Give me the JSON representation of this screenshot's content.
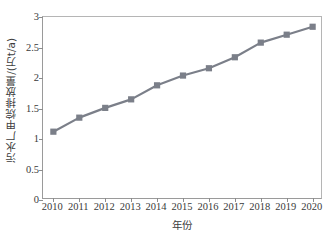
{
  "chart_data": {
    "type": "line",
    "title": "",
    "xlabel": "年份",
    "ylabel": "污水厂甲烷排放量/(万t/a)",
    "categories": [
      "2010",
      "2011",
      "2012",
      "2013",
      "2014",
      "2015",
      "2016",
      "2017",
      "2018",
      "2019",
      "2020"
    ],
    "x": [
      2010,
      2011,
      2012,
      2013,
      2014,
      2015,
      2016,
      2017,
      2018,
      2019,
      2020
    ],
    "values": [
      1.12,
      1.35,
      1.51,
      1.65,
      1.88,
      2.04,
      2.16,
      2.34,
      2.58,
      2.71,
      2.84
    ],
    "series": [
      {
        "name": "污水厂甲烷排放量",
        "values": [
          1.12,
          1.35,
          1.51,
          1.65,
          1.88,
          2.04,
          2.16,
          2.34,
          2.58,
          2.71,
          2.84
        ]
      }
    ],
    "ylim": [
      0,
      3
    ],
    "yticks": [
      "0",
      "0.5",
      "1",
      "1.5",
      "2",
      "2.5",
      "3"
    ],
    "ytick_values": [
      0,
      0.5,
      1,
      1.5,
      2,
      2.5,
      3
    ],
    "xlim": [
      2009.6,
      2020.4
    ],
    "grid": false,
    "legend": "none",
    "marker": "square",
    "series_color": "#7b7f89",
    "line_color": "#7b7f89",
    "axis_color": "#9a9a9a",
    "text_color": "#3a3a3a",
    "background": "#ffffff"
  }
}
